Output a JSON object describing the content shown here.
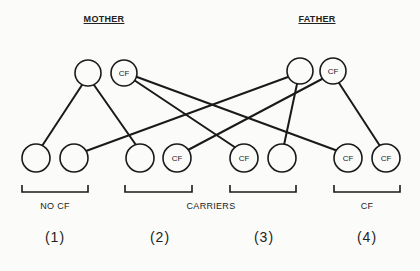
{
  "labels": {
    "mother": "MOTHER",
    "father": "FATHER"
  },
  "parents": {
    "mother": [
      {
        "id": "m1",
        "x": 88,
        "y": 73,
        "label": ""
      },
      {
        "id": "m2",
        "x": 124,
        "y": 73,
        "label": "CF"
      }
    ],
    "father": [
      {
        "id": "f1",
        "x": 300,
        "y": 71,
        "label": ""
      },
      {
        "id": "f2",
        "x": 333,
        "y": 71,
        "label": "CF"
      }
    ]
  },
  "offspring": [
    {
      "id": "o1",
      "x": 36,
      "y": 158,
      "label": ""
    },
    {
      "id": "o2",
      "x": 74,
      "y": 158,
      "label": ""
    },
    {
      "id": "o3",
      "x": 140,
      "y": 158,
      "label": ""
    },
    {
      "id": "o4",
      "x": 177,
      "y": 158,
      "label": "CF"
    },
    {
      "id": "o5",
      "x": 244,
      "y": 158,
      "label": "CF"
    },
    {
      "id": "o6",
      "x": 282,
      "y": 158,
      "label": ""
    },
    {
      "id": "o7",
      "x": 348,
      "y": 158,
      "label": "CF"
    },
    {
      "id": "o8",
      "x": 386,
      "y": 158,
      "label": "CF"
    }
  ],
  "groups": [
    {
      "label": "NO CF",
      "number": "(1)",
      "x": 55
    },
    {
      "label": "",
      "number": "(2)",
      "x": 160
    },
    {
      "label": "",
      "number": "(3)",
      "x": 264
    },
    {
      "label": "CF",
      "number": "(4)",
      "x": 367
    }
  ],
  "carriers_label": "CARRIERS",
  "circle_radius": 13
}
